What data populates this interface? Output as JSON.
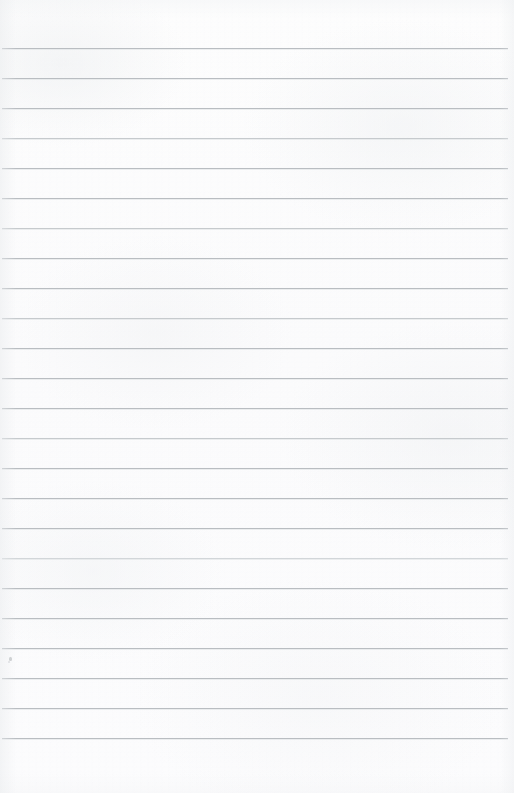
{
  "document": {
    "type": "scanned-ruled-notebook-page",
    "title": "Blank Ruled Paper",
    "content_text": "",
    "is_blank": true,
    "page_width": 514,
    "page_height": 793
  },
  "paper": {
    "background_color": "#fcfcfc",
    "tint_color": "#f4f5f7",
    "edge_shadow_color": "#ebedef"
  },
  "ruling": {
    "line_color": "#b9bdc1",
    "line_color_soft": "#c6cacd",
    "line_color_faint": "#d2d6d9",
    "line_thickness": 1,
    "line_spacing": 30,
    "first_line_y": 48,
    "last_line_y": 738,
    "line_left_x": 2,
    "line_right_x": 508,
    "line_count": 24,
    "lines": [
      {
        "y": 48,
        "weight": "normal"
      },
      {
        "y": 78,
        "weight": "normal"
      },
      {
        "y": 108,
        "weight": "normal"
      },
      {
        "y": 138,
        "weight": "soft"
      },
      {
        "y": 168,
        "weight": "normal"
      },
      {
        "y": 198,
        "weight": "normal"
      },
      {
        "y": 228,
        "weight": "soft"
      },
      {
        "y": 258,
        "weight": "normal"
      },
      {
        "y": 288,
        "weight": "normal"
      },
      {
        "y": 318,
        "weight": "soft"
      },
      {
        "y": 348,
        "weight": "normal"
      },
      {
        "y": 378,
        "weight": "normal"
      },
      {
        "y": 408,
        "weight": "normal"
      },
      {
        "y": 438,
        "weight": "soft"
      },
      {
        "y": 468,
        "weight": "normal"
      },
      {
        "y": 498,
        "weight": "normal"
      },
      {
        "y": 528,
        "weight": "normal"
      },
      {
        "y": 558,
        "weight": "faint"
      },
      {
        "y": 588,
        "weight": "normal"
      },
      {
        "y": 618,
        "weight": "normal"
      },
      {
        "y": 648,
        "weight": "normal"
      },
      {
        "y": 678,
        "weight": "normal"
      },
      {
        "y": 708,
        "weight": "normal"
      },
      {
        "y": 738,
        "weight": "normal"
      }
    ]
  },
  "margins": {
    "top_margin_height": 48,
    "bottom_margin_height": 55
  },
  "marks": [
    {
      "name": "pencil-dot",
      "x": 9,
      "y": 657
    }
  ]
}
